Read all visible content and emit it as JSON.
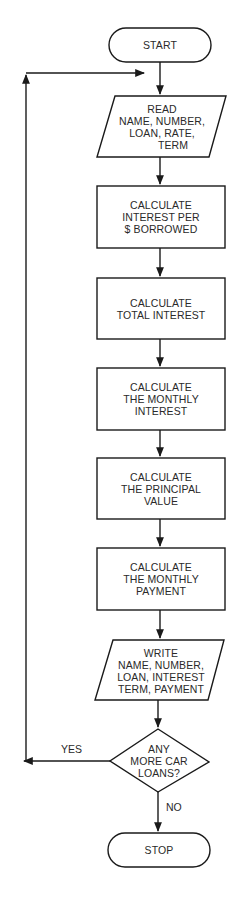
{
  "diagram": {
    "type": "flowchart",
    "colors": {
      "stroke": "#1a1a1a",
      "text": "#2a2a2a",
      "background": "#ffffff"
    },
    "nodes": [
      {
        "id": "start",
        "shape": "terminal",
        "lines": [
          "START"
        ]
      },
      {
        "id": "read",
        "shape": "parallelogram",
        "lines": [
          "READ",
          "NAME, NUMBER,",
          "LOAN, RATE,",
          "TERM"
        ]
      },
      {
        "id": "calc_interest_per_dollar",
        "shape": "rectangle",
        "lines": [
          "CALCULATE",
          "INTEREST PER",
          "$ BORROWED"
        ]
      },
      {
        "id": "calc_total_interest",
        "shape": "rectangle",
        "lines": [
          "CALCULATE",
          "TOTAL INTEREST"
        ]
      },
      {
        "id": "calc_monthly_interest",
        "shape": "rectangle",
        "lines": [
          "CALCULATE",
          "THE MONTHLY",
          "INTEREST"
        ]
      },
      {
        "id": "calc_principal",
        "shape": "rectangle",
        "lines": [
          "CALCULATE",
          "THE PRINCIPAL",
          "VALUE"
        ]
      },
      {
        "id": "calc_monthly_payment",
        "shape": "rectangle",
        "lines": [
          "CALCULATE",
          "THE MONTHLY",
          "PAYMENT"
        ]
      },
      {
        "id": "write",
        "shape": "parallelogram",
        "lines": [
          "WRITE",
          "NAME, NUMBER,",
          "LOAN, INTEREST",
          "TERM, PAYMENT"
        ]
      },
      {
        "id": "decision",
        "shape": "diamond",
        "lines": [
          "ANY",
          "MORE CAR",
          "LOANS?"
        ]
      },
      {
        "id": "stop",
        "shape": "terminal",
        "lines": [
          "STOP"
        ]
      }
    ],
    "edges": [
      {
        "from": "start",
        "to": "read",
        "label": ""
      },
      {
        "from": "read",
        "to": "calc_interest_per_dollar",
        "label": ""
      },
      {
        "from": "calc_interest_per_dollar",
        "to": "calc_total_interest",
        "label": ""
      },
      {
        "from": "calc_total_interest",
        "to": "calc_monthly_interest",
        "label": ""
      },
      {
        "from": "calc_monthly_interest",
        "to": "calc_principal",
        "label": ""
      },
      {
        "from": "calc_principal",
        "to": "calc_monthly_payment",
        "label": ""
      },
      {
        "from": "calc_monthly_payment",
        "to": "write",
        "label": ""
      },
      {
        "from": "write",
        "to": "decision",
        "label": ""
      },
      {
        "from": "decision",
        "to": "read",
        "label": "YES"
      },
      {
        "from": "decision",
        "to": "stop",
        "label": "NO"
      }
    ],
    "labels": {
      "yes": "YES",
      "no": "NO"
    }
  }
}
